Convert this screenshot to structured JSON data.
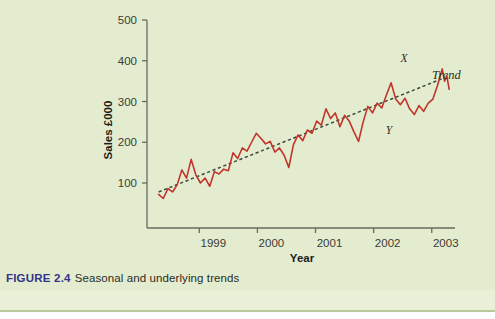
{
  "caption": {
    "figure_label": "FIGURE 2.4",
    "text": "Seasonal and underlying trends"
  },
  "colors": {
    "background": "#e4ecd0",
    "series": "#c0352b",
    "trend": "#3d4a3a",
    "axis": "#6a6a5e",
    "caption_accent": "#33348c"
  },
  "chart_data": {
    "type": "line",
    "title": "",
    "subtitle": "",
    "xlabel": "Year",
    "ylabel": "Sales £000",
    "xlim": [
      1998.1,
      2003.4
    ],
    "ylim": [
      0,
      520
    ],
    "grid": false,
    "legend": "none",
    "y_ticks": [
      100,
      200,
      300,
      400,
      500
    ],
    "x_ticks": [
      1999,
      2000,
      2001,
      2002,
      2003
    ],
    "x_tick_labels": [
      "1999",
      "2000",
      "2001",
      "2002",
      "2003"
    ],
    "y_tick_labels": [
      "100",
      "200",
      "300",
      "400",
      "500"
    ],
    "annotations": [
      {
        "label": "X",
        "x": 2002.52,
        "y": 405,
        "note": "seasonal peak above trend"
      },
      {
        "label": "Y",
        "x": 2002.15,
        "y": 243,
        "note": "seasonal trough below trend"
      },
      {
        "label": "Trend",
        "x": 2003.12,
        "y": 372,
        "note": "dotted underlying trend line"
      }
    ],
    "series": [
      {
        "name": "Sales",
        "style": "solid",
        "color": "#c0352b",
        "x": [
          1998.3,
          1998.38,
          1998.46,
          1998.54,
          1998.62,
          1998.7,
          1998.78,
          1998.86,
          1998.94,
          1999.02,
          1999.1,
          1999.18,
          1999.26,
          1999.34,
          1999.42,
          1999.5,
          1999.58,
          1999.66,
          1999.74,
          1999.82,
          1999.9,
          1999.98,
          2000.06,
          2000.14,
          2000.22,
          2000.3,
          2000.38,
          2000.46,
          2000.54,
          2000.62,
          2000.7,
          2000.78,
          2000.86,
          2000.94,
          2001.02,
          2001.1,
          2001.18,
          2001.26,
          2001.34,
          2001.42,
          2001.5,
          2001.58,
          2001.66,
          2001.74,
          2001.82,
          2001.9,
          2001.98,
          2002.06,
          2002.14,
          2002.22,
          2002.3,
          2002.38,
          2002.46,
          2002.54,
          2002.62,
          2002.7,
          2002.78,
          2002.86,
          2002.94,
          2003.02,
          2003.1,
          2003.18
        ],
        "values": [
          72,
          62,
          86,
          78,
          96,
          132,
          112,
          158,
          120,
          100,
          112,
          92,
          128,
          122,
          134,
          130,
          174,
          160,
          186,
          178,
          200,
          222,
          210,
          196,
          202,
          176,
          186,
          168,
          138,
          194,
          218,
          204,
          230,
          222,
          252,
          242,
          282,
          258,
          272,
          238,
          266,
          252,
          226,
          202,
          250,
          288,
          272,
          296,
          284,
          316,
          346,
          306,
          292,
          308,
          282,
          268,
          290,
          276,
          296,
          306,
          340,
          380
        ]
      },
      {
        "name": "Trend",
        "style": "dotted",
        "color": "#3d4a3a",
        "x": [
          1998.3,
          2003.18
        ],
        "values": [
          78,
          356
        ]
      }
    ],
    "series_tail": {
      "note": "final descending seasonal leg after peak X",
      "x": [
        2003.18,
        2003.22,
        2003.26,
        2003.3
      ],
      "values": [
        380,
        350,
        362,
        330
      ]
    }
  }
}
